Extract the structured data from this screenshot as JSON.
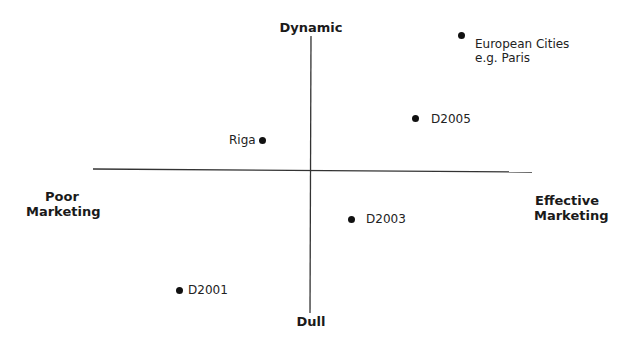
{
  "diagram": {
    "type": "perceptual-map",
    "axes": {
      "top": "Dynamic",
      "bottom": "Dull",
      "left_line1": "Poor",
      "left_line2": "Marketing",
      "right_line1": "Effective",
      "right_line2": "Marketing"
    },
    "points": [
      {
        "id": "european-cities",
        "label_line1": "European Cities",
        "label_line2": "e.g. Paris",
        "x": 462,
        "y": 36,
        "label_side": "right"
      },
      {
        "id": "d2005",
        "label_line1": "D2005",
        "x": 416,
        "y": 119,
        "label_side": "right"
      },
      {
        "id": "riga",
        "label_line1": "Riga",
        "x": 263,
        "y": 140,
        "label_side": "left"
      },
      {
        "id": "d2003",
        "label_line1": "D2003",
        "x": 352,
        "y": 219,
        "label_side": "right"
      },
      {
        "id": "d2001",
        "label_line1": "D2001",
        "x": 179,
        "y": 290,
        "label_side": "right"
      }
    ],
    "colors": {
      "line": "#333333",
      "dot": "#111111",
      "background": "#ffffff"
    }
  }
}
